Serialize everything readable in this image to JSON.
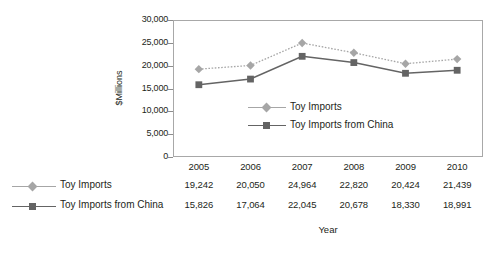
{
  "chart_data": {
    "type": "line",
    "title": "",
    "xlabel": "Year",
    "ylabel": "$Millions",
    "categories": [
      "2005",
      "2006",
      "2007",
      "2008",
      "2009",
      "2010"
    ],
    "series": [
      {
        "name": "Toy Imports",
        "values": [
          19242,
          20050,
          24964,
          22820,
          20424,
          21439
        ],
        "value_labels": [
          "19,242",
          "20,050",
          "24,964",
          "22,820",
          "20,424",
          "21,439"
        ],
        "color": "#a6a6a6",
        "marker": "diamond",
        "line_style": "dotted"
      },
      {
        "name": "Toy Imports from China",
        "values": [
          15826,
          17064,
          22045,
          20678,
          18330,
          18991
        ],
        "value_labels": [
          "15,826",
          "17,064",
          "22,045",
          "20,678",
          "18,330",
          "18,991"
        ],
        "color": "#646464",
        "marker": "square",
        "line_style": "solid"
      }
    ],
    "ylim": [
      0,
      30000
    ],
    "ytick_labels": [
      "30,000",
      "25,000",
      "20,000",
      "15,000",
      "10,000",
      "5,000",
      "0"
    ],
    "ytick_values": [
      30000,
      25000,
      20000,
      15000,
      10000,
      5000,
      0
    ],
    "grid": false,
    "legend_position": "inside-center",
    "data_table": true
  },
  "colors": {
    "series1": "#a6a6a6",
    "series2": "#646464",
    "axis": "#8d8d8d",
    "frame": "#a8a8a8",
    "text": "#231f20",
    "background": "#ffffff"
  }
}
